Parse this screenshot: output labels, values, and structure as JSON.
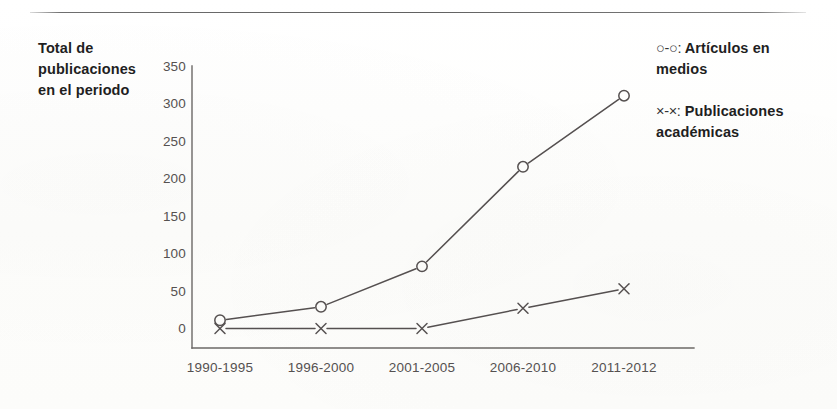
{
  "figure": {
    "axis_title_lines": [
      "Total de",
      "publicaciones",
      "en el periodo"
    ],
    "rule_color": "#555555",
    "axis_color": "#6b6866",
    "line_color": "#555050",
    "tick_text_color": "#555150",
    "title_text_color": "#1f1f1f"
  },
  "legend": {
    "items": [
      {
        "symbol": "○-○:",
        "label_line1": "Artículos en",
        "label_line2": "medios"
      },
      {
        "symbol": "×-×:",
        "label_line1": "Publicaciones",
        "label_line2": "académicas"
      }
    ]
  },
  "chart_data": {
    "type": "line",
    "title": "Total de publicaciones en el periodo",
    "xlabel": "",
    "ylabel": "Total de publicaciones en el periodo",
    "categories": [
      "1990-1995",
      "1996-2000",
      "2001-2005",
      "2006-2010",
      "2011-2012"
    ],
    "ylim": [
      0,
      350
    ],
    "yticks": [
      0,
      50,
      100,
      150,
      200,
      250,
      300,
      350
    ],
    "ytick_labels": [
      "0",
      "50",
      "100",
      "150",
      "200",
      "250",
      "300",
      "350"
    ],
    "grid": false,
    "legend_position": "right",
    "series": [
      {
        "name": "Artículos en medios",
        "marker": "circle",
        "values": [
          13,
          31,
          85,
          218,
          313
        ]
      },
      {
        "name": "Publicaciones académicas",
        "marker": "x",
        "values": [
          2,
          2,
          2,
          29,
          55
        ]
      }
    ]
  }
}
